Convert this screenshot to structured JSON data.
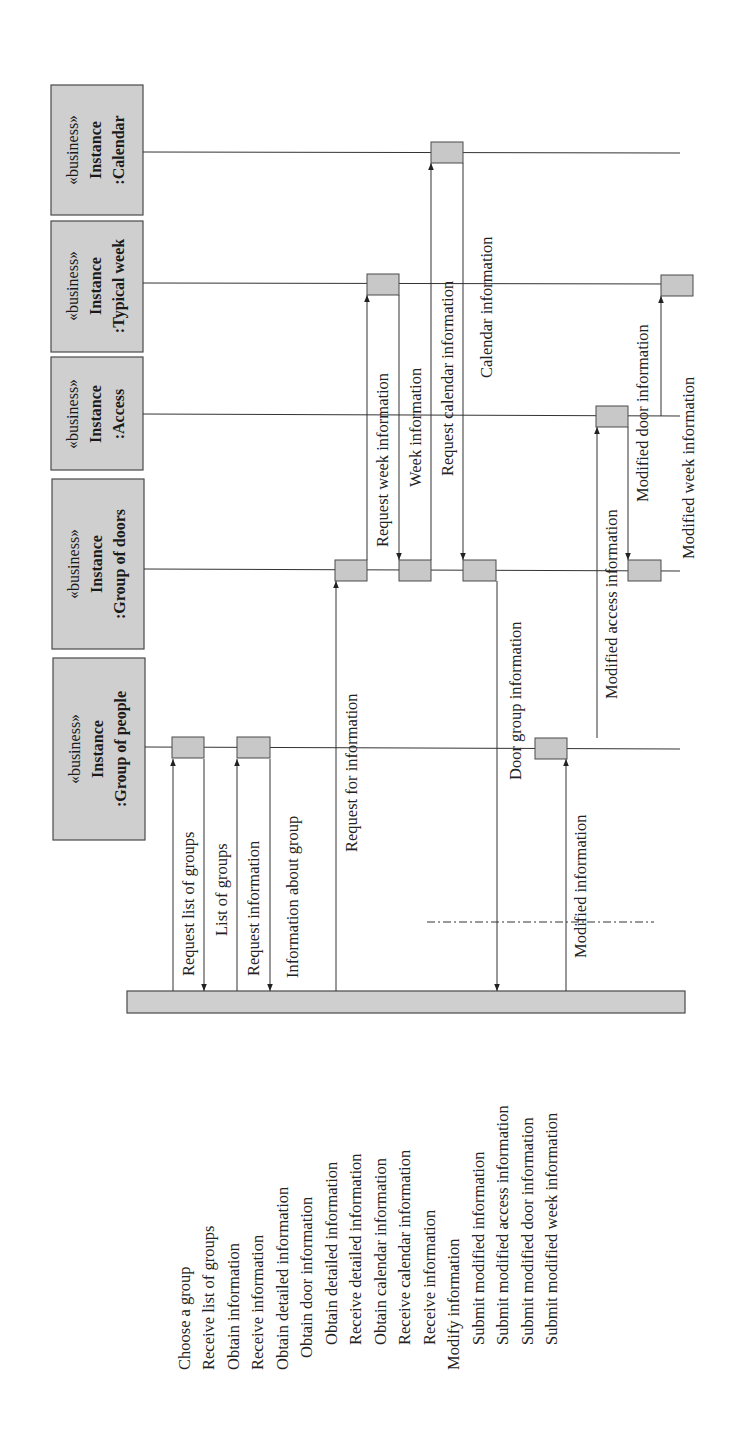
{
  "diagram": {
    "type": "sequence-diagram",
    "orientation": "rotated-90-ccw",
    "actors": [
      {
        "stereotype": "«business»",
        "kind": "Instance",
        "name": ":Calendar"
      },
      {
        "stereotype": "«business»",
        "kind": "Instance",
        "name": ":Typical week"
      },
      {
        "stereotype": "«business»",
        "kind": "Instance",
        "name": ":Access"
      },
      {
        "stereotype": "«business»",
        "kind": "Instance",
        "name": ":Group of doors"
      },
      {
        "stereotype": "«business»",
        "kind": "Instance",
        "name": ":Group of people"
      }
    ],
    "messages": [
      {
        "label": "Request list of groups",
        "from": "system",
        "to": ":Group of people"
      },
      {
        "label": "List of groups",
        "from": ":Group of people",
        "to": "system"
      },
      {
        "label": "Request information",
        "from": "system",
        "to": ":Group of people"
      },
      {
        "label": "Information about group",
        "from": ":Group of people",
        "to": "system"
      },
      {
        "label": "Request for information",
        "from": "system",
        "to": ":Group of doors"
      },
      {
        "label": "Request week information",
        "from": ":Group of doors",
        "to": ":Typical week"
      },
      {
        "label": "Week information",
        "from": ":Typical week",
        "to": ":Group of doors"
      },
      {
        "label": "Request calendar information",
        "from": ":Group of doors",
        "to": ":Calendar"
      },
      {
        "label": "Calendar information",
        "from": ":Calendar",
        "to": ":Group of doors"
      },
      {
        "label": "Door group information",
        "from": ":Group of doors",
        "to": "system"
      },
      {
        "label": "Modified information",
        "from": "system",
        "to": ":Group of people"
      },
      {
        "label": "Modified access information",
        "from": ":Group of people",
        "to": ":Access"
      },
      {
        "label": "Modified door information",
        "from": ":Access",
        "to": ":Group of doors"
      },
      {
        "label": "Modified week information",
        "from": ":Access",
        "to": ":Typical week"
      }
    ],
    "activities": [
      {
        "label": "Choose a group",
        "indent": 0
      },
      {
        "label": "Receive list of groups",
        "indent": 0
      },
      {
        "label": "Obtain information",
        "indent": 0
      },
      {
        "label": "Receive information",
        "indent": 0
      },
      {
        "label": "Obtain detailed information",
        "indent": 0
      },
      {
        "label": "Obtain door information",
        "indent": 1
      },
      {
        "label": "Obtain detailed information",
        "indent": 1
      },
      {
        "label": "Receive detailed information",
        "indent": 1
      },
      {
        "label": "Obtain calendar information",
        "indent": 1
      },
      {
        "label": "Receive calendar information",
        "indent": 1
      },
      {
        "label": "Receive information",
        "indent": 1
      },
      {
        "label": "Modify information",
        "indent": 0
      },
      {
        "label": "Submit modified information",
        "indent": 1
      },
      {
        "label": "Submit modified access information",
        "indent": 1
      },
      {
        "label": "Submit modified door information",
        "indent": 1
      },
      {
        "label": "Submit modified week information",
        "indent": 1
      }
    ]
  }
}
